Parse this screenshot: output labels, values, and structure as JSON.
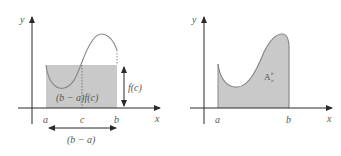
{
  "colors": {
    "axis": "#2a2a2a",
    "fill": "#c9c9c9",
    "curve": "#8a8a8a",
    "label": "#555555",
    "background": "#ffffff"
  },
  "left_diagram": {
    "title": "Mean value theorem for integrals",
    "axis_labels": {
      "x": "x",
      "y": "y"
    },
    "tick_labels": {
      "a": "a",
      "c": "c",
      "b": "b"
    },
    "rect_label": "(b − a)f(c)",
    "height_label": "f(c)",
    "width_label": "(b − a)"
  },
  "right_diagram": {
    "title": "Area under curve",
    "axis_labels": {
      "x": "x",
      "y": "y"
    },
    "tick_labels": {
      "a": "a",
      "b": "b"
    },
    "area_label_main": "A",
    "area_label_sup": "b",
    "area_label_sub": "a"
  }
}
